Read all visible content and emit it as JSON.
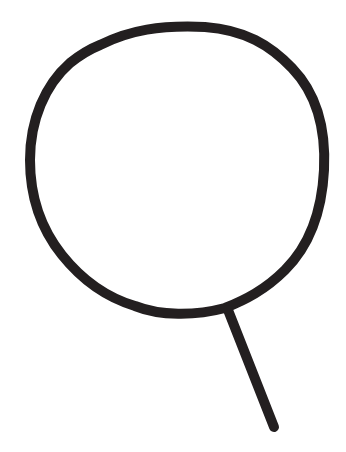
{
  "drawing": {
    "subject": "circle-with-stem",
    "stroke_color": "#231f20",
    "background_color": "#ffffff",
    "stroke_width": 10
  }
}
